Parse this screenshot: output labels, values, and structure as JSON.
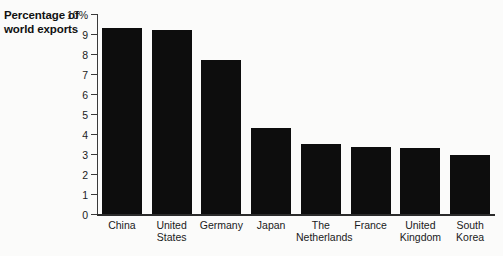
{
  "chart_data": {
    "type": "bar",
    "title": "",
    "subtitle": "",
    "xlabel": "",
    "ylabel": "Percentage of world exports",
    "ylabel_lines": [
      "Percentage of",
      "world exports"
    ],
    "categories": [
      "China",
      "United States",
      "Germany",
      "Japan",
      "The Netherlands",
      "France",
      "United Kingdom",
      "South Korea"
    ],
    "category_lines": [
      [
        "China"
      ],
      [
        "United",
        "States"
      ],
      [
        "Germany"
      ],
      [
        "Japan"
      ],
      [
        "The",
        "Netherlands"
      ],
      [
        "France"
      ],
      [
        "United",
        "Kingdom"
      ],
      [
        "South",
        "Korea"
      ]
    ],
    "values": [
      9.3,
      9.2,
      7.7,
      4.3,
      3.5,
      3.35,
      3.3,
      2.95
    ],
    "ylim": [
      0,
      10
    ],
    "ytick_values": [
      0,
      1,
      2,
      3,
      4,
      5,
      6,
      7,
      8,
      9,
      10
    ],
    "ytick_labels": [
      "0",
      "1",
      "2",
      "3",
      "4",
      "5",
      "6",
      "7",
      "8",
      "9",
      "10%"
    ],
    "grid": false,
    "legend": null,
    "bar_color": "#0d0d0d",
    "background_color": "#fbfbfa",
    "axis_color": "#2b2b2b"
  }
}
